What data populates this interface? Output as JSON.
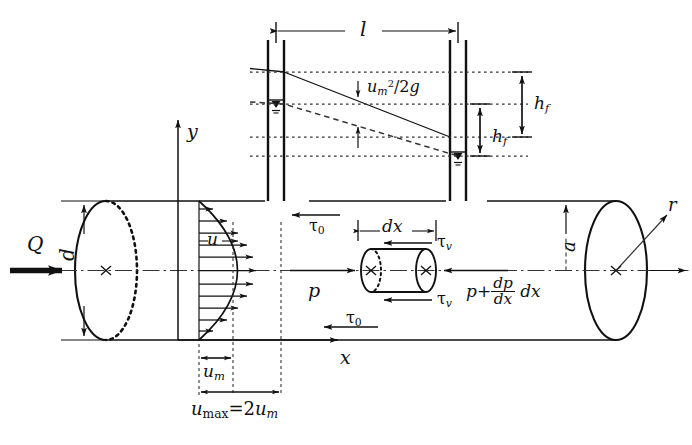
{
  "figure": {
    "colors": {
      "line": "#111111",
      "background": "#ffffff",
      "dash": "#333333"
    }
  },
  "labels": {
    "length_l": "l",
    "velocity_head": {
      "u": "u",
      "m": "m",
      "exp": "2",
      "over": "/2",
      "g": "g"
    },
    "head_loss_upper": {
      "h": "h",
      "f": "f"
    },
    "head_loss_lower": {
      "h": "h",
      "f": "f"
    },
    "axis_y": "y",
    "axis_x": "x",
    "axis_r": "r",
    "discharge_Q": "Q",
    "diameter_d": "d",
    "radius_a": "a",
    "velocity_u": "u",
    "mean_velocity": {
      "u": "u",
      "m": "m"
    },
    "max_velocity": {
      "u": "u",
      "max": "max",
      "eq": "=2",
      "u2": "u",
      "m": "m"
    },
    "wall_shear_top": {
      "t": "τ",
      "sub": "0"
    },
    "wall_shear_bottom": {
      "t": "τ",
      "sub": "0"
    },
    "element_shear_top": {
      "t": "τ",
      "sub": "v"
    },
    "element_shear_bottom": {
      "t": "τ",
      "sub": "v"
    },
    "element_length": "dx",
    "pressure_p": "p",
    "pressure_gradient": {
      "p": "p",
      "plus": "+",
      "num": "dp",
      "den": "dx",
      "dx": "dx"
    }
  }
}
